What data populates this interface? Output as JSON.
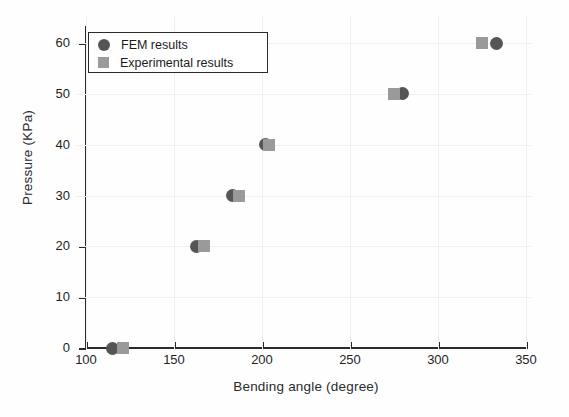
{
  "chart_data": {
    "type": "scatter",
    "title": "",
    "xlabel": "Bending angle (degree)",
    "ylabel": "Pressure (KPa)",
    "xlim": [
      100,
      350
    ],
    "ylim": [
      0,
      60
    ],
    "xticks": [
      100,
      150,
      200,
      250,
      300,
      350
    ],
    "yticks": [
      0,
      10,
      20,
      30,
      40,
      50,
      60
    ],
    "grid": true,
    "legend_position": "upper left",
    "series": [
      {
        "name": "FEM results",
        "marker": "circle",
        "color": "#555555",
        "points": [
          {
            "x": 115,
            "y": 0
          },
          {
            "x": 163,
            "y": 20
          },
          {
            "x": 183,
            "y": 30
          },
          {
            "x": 202,
            "y": 40
          },
          {
            "x": 280,
            "y": 50
          },
          {
            "x": 333,
            "y": 60
          }
        ]
      },
      {
        "name": "Experimental results",
        "marker": "square",
        "color": "#9a9a9a",
        "points": [
          {
            "x": 121,
            "y": 0
          },
          {
            "x": 167,
            "y": 20
          },
          {
            "x": 187,
            "y": 30
          },
          {
            "x": 204,
            "y": 40
          },
          {
            "x": 275,
            "y": 50
          },
          {
            "x": 325,
            "y": 60
          }
        ]
      }
    ]
  },
  "legend": {
    "entries": [
      {
        "label": "FEM results"
      },
      {
        "label": "Experimental results"
      }
    ]
  },
  "ticks": {
    "x": [
      "100",
      "150",
      "200",
      "250",
      "300",
      "350"
    ],
    "y": [
      "0",
      "10",
      "20",
      "30",
      "40",
      "50",
      "60"
    ]
  },
  "colors": {
    "fem": "#555555",
    "experimental": "#9a9a9a",
    "axis": "#2a2a2a",
    "grid": "#eef0f4",
    "background": "#fefefe"
  }
}
